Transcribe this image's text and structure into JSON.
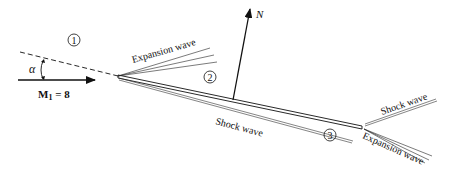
{
  "figure": {
    "labels": {
      "region1": "1",
      "region2": "2",
      "region3": "3",
      "angle": "α",
      "mach": "M",
      "mach_sub": "1",
      "mach_value": " = 8",
      "normal": "N",
      "expansion_le": "Expansion wave",
      "shock_le": "Shock wave",
      "shock_te": "Shock wave",
      "expansion_te": "Expansion wave"
    },
    "colors": {
      "ink": "#111111",
      "background": "#ffffff"
    }
  }
}
